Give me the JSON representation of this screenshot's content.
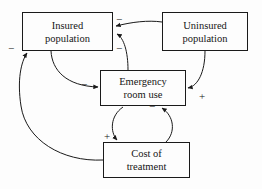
{
  "diagram": {
    "type": "causal-loop-diagram",
    "background_color": "#fdfdfd",
    "stroke_color": "#1a1a1a",
    "nodes": [
      {
        "id": "insured-population",
        "line1": "Insured",
        "line2": "population",
        "x": 22,
        "y": 12,
        "w": 91,
        "h": 39
      },
      {
        "id": "uninsured-population",
        "line1": "Uninsured",
        "line2": "population",
        "x": 162,
        "y": 12,
        "w": 86,
        "h": 39
      },
      {
        "id": "emergency-room-use",
        "line1": "Emergency",
        "line2": "room use",
        "x": 100,
        "y": 70,
        "w": 86,
        "h": 36
      },
      {
        "id": "cost-of-treatment",
        "line1": "Cost of",
        "line2": "treatment",
        "x": 103,
        "y": 142,
        "w": 87,
        "h": 36
      }
    ],
    "edges": [
      {
        "id": "uninsured-to-insured",
        "from": "uninsured-population",
        "to": "insured-population",
        "sign": "−",
        "sign_x": 116,
        "sign_y": 14
      },
      {
        "id": "emergency-to-insured",
        "from": "emergency-room-use",
        "to": "insured-population",
        "sign": "−",
        "sign_x": 116,
        "sign_y": 43
      },
      {
        "id": "cost-to-insured",
        "from": "cost-of-treatment",
        "to": "insured-population",
        "sign": "−",
        "sign_x": 8,
        "sign_y": 43
      },
      {
        "id": "insured-to-emergency",
        "from": "insured-population",
        "to": "emergency-room-use",
        "sign": "−",
        "sign_x": 81,
        "sign_y": 79
      },
      {
        "id": "uninsured-to-emergency",
        "from": "uninsured-population",
        "to": "emergency-room-use",
        "sign": "+",
        "sign_x": 199,
        "sign_y": 91
      },
      {
        "id": "emergency-to-cost",
        "from": "emergency-room-use",
        "to": "cost-of-treatment",
        "sign": "+",
        "sign_x": 104,
        "sign_y": 131
      },
      {
        "id": "cost-to-emergency",
        "from": "cost-of-treatment",
        "to": "emergency-room-use",
        "sign": "−",
        "sign_x": 149,
        "sign_y": 101
      }
    ]
  }
}
